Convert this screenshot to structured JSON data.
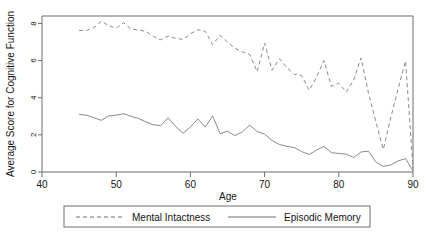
{
  "chart_data": {
    "type": "line",
    "title": "",
    "xlabel": "Age",
    "ylabel": "Average Score for Cognitive Function",
    "xlim": [
      40,
      90
    ],
    "ylim": [
      0,
      8.4
    ],
    "xticks": [
      40,
      50,
      60,
      70,
      80,
      90
    ],
    "yticks": [
      0,
      2,
      4,
      6,
      8
    ],
    "grid": false,
    "legend_position": "below-axes",
    "x": [
      45,
      46,
      47,
      48,
      49,
      50,
      51,
      52,
      53,
      54,
      55,
      56,
      57,
      58,
      59,
      60,
      61,
      62,
      63,
      64,
      65,
      66,
      67,
      68,
      69,
      70,
      71,
      72,
      73,
      74,
      75,
      76,
      77,
      78,
      79,
      80,
      81,
      82,
      83,
      84,
      85,
      86,
      87,
      88,
      89,
      90
    ],
    "series": [
      {
        "name": "Mental Intactness",
        "style": "dashed",
        "values": [
          7.62,
          7.62,
          7.78,
          8.12,
          7.88,
          7.74,
          8.04,
          7.7,
          7.64,
          7.58,
          7.3,
          7.12,
          7.32,
          7.2,
          7.14,
          7.44,
          7.66,
          7.58,
          6.86,
          7.36,
          7.0,
          6.66,
          6.48,
          6.32,
          5.4,
          6.94,
          5.48,
          6.1,
          5.62,
          5.26,
          5.2,
          4.4,
          5.1,
          6.0,
          4.62,
          4.78,
          4.3,
          4.96,
          6.14,
          4.24,
          2.7,
          1.22,
          2.92,
          4.5,
          5.98,
          0.22
        ]
      },
      {
        "name": "Episodic Memory",
        "style": "solid",
        "values": [
          3.1,
          3.06,
          2.92,
          2.78,
          3.02,
          3.06,
          3.14,
          3.0,
          2.88,
          2.7,
          2.54,
          2.5,
          2.92,
          2.46,
          2.08,
          2.42,
          2.86,
          2.42,
          3.02,
          2.06,
          2.2,
          1.96,
          2.16,
          2.52,
          2.18,
          2.04,
          1.7,
          1.48,
          1.38,
          1.32,
          1.1,
          0.94,
          1.18,
          1.38,
          1.04,
          1.0,
          0.96,
          0.78,
          1.08,
          1.12,
          0.54,
          0.3,
          0.38,
          0.6,
          0.72,
          0.06
        ]
      }
    ]
  },
  "legend": {
    "items": [
      {
        "label": "Mental Intactness",
        "style": "dashed"
      },
      {
        "label": "Episodic Memory",
        "style": "solid"
      }
    ]
  },
  "axes": {
    "x_title": "Age",
    "y_title": "Average Score for Cognitive Function",
    "x_tick_labels": [
      "40",
      "50",
      "60",
      "70",
      "80",
      "90"
    ],
    "y_tick_labels": [
      "0",
      "2",
      "4",
      "6",
      "8"
    ]
  },
  "colors": {
    "line": "#8a8a8a",
    "axis": "#6e6e6e",
    "text": "#141414",
    "background": "#ffffff"
  }
}
